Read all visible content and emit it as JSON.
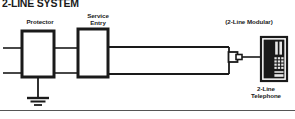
{
  "figure": {
    "title": "2-LINE SYSTEM",
    "width": 295,
    "height": 119,
    "background": "#ffffff",
    "line_color": "#1a1a1a",
    "rule_color": "#555555"
  },
  "labels": {
    "protector": "Protector",
    "service_entry": "Service\nEntry",
    "service_entry_line1": "Service",
    "service_entry_line2": "Entry",
    "modular": "(2-Line Modular)",
    "telephone_line1": "2-Line",
    "telephone_line2": "Telephone"
  },
  "diagram": {
    "type": "schematic",
    "nodes": [
      {
        "name": "protector-box",
        "label": "Protector",
        "x": 22,
        "y": 31,
        "width": 32,
        "height": 46
      },
      {
        "name": "service-entry-box",
        "label": "Service Entry",
        "x": 78,
        "y": 29,
        "width": 30,
        "height": 48
      },
      {
        "name": "modular-connector",
        "label": "(2-Line Modular)",
        "x": 228,
        "y": 50,
        "width": 16,
        "height": 14
      },
      {
        "name": "telephone",
        "label": "2-Line Telephone",
        "x": 262,
        "y": 38,
        "width": 24,
        "height": 42
      },
      {
        "name": "ground-symbol",
        "label": "ground",
        "x": 38,
        "y": 77
      }
    ],
    "line_pair_y": [
      48,
      73
    ],
    "ground": {
      "bars": 3,
      "stem_top": 77,
      "stem_bottom": 98
    },
    "footer_rule_y": 110
  },
  "telephone_icon": {
    "name": "2-line-telephone-icon",
    "body_color": "#1a1a1a",
    "keypad_color": "#e8e8e8",
    "keypad_rows": 4,
    "keypad_cols": 3,
    "line_buttons": 2
  }
}
